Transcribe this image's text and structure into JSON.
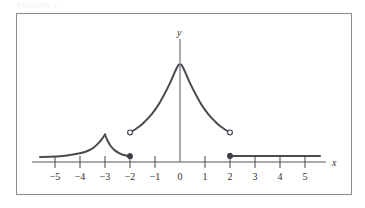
{
  "figure": {
    "caption_faint": "FIGURE 1",
    "frame_color": "#8a8a90",
    "curve_color": "#4a4a52",
    "axis_color": "#55555c",
    "background": "#ffffff"
  },
  "axes": {
    "x_label": "x",
    "y_label": "y",
    "x_ticks": [
      {
        "value": -5,
        "label": "−5"
      },
      {
        "value": -4,
        "label": "−4"
      },
      {
        "value": -3,
        "label": "−3"
      },
      {
        "value": -2,
        "label": "−2"
      },
      {
        "value": -1,
        "label": "−1"
      },
      {
        "value": 0,
        "label": "0"
      },
      {
        "value": 1,
        "label": "1"
      },
      {
        "value": 2,
        "label": "2"
      },
      {
        "value": 3,
        "label": "3"
      },
      {
        "value": 4,
        "label": "4"
      },
      {
        "value": 5,
        "label": "5"
      }
    ],
    "x_range": [
      -5.8,
      5.8
    ],
    "y_range": [
      -0.35,
      3.6
    ],
    "y_axis_at_x": 0,
    "grid": false,
    "legend": false
  },
  "chart_data": {
    "type": "line",
    "title": "",
    "subtitle": "",
    "xlabel": "x",
    "ylabel": "y",
    "xlim": [
      -5.8,
      5.8
    ],
    "ylim": [
      -0.35,
      3.6
    ],
    "grid": false,
    "legend_position": "none",
    "series": [
      {
        "name": "left-tail-branch",
        "comment": "flat tail rising to cusp at x = -3",
        "points": [
          [
            -5.6,
            0.17
          ],
          [
            -5.2,
            0.18
          ],
          [
            -4.8,
            0.2
          ],
          [
            -4.4,
            0.24
          ],
          [
            -4.0,
            0.3
          ],
          [
            -3.7,
            0.38
          ],
          [
            -3.45,
            0.5
          ],
          [
            -3.25,
            0.66
          ],
          [
            -3.1,
            0.82
          ],
          [
            -3.0,
            0.95
          ]
        ]
      },
      {
        "name": "cusp-descending-branch",
        "comment": "descends from cusp at x = -3 to closed endpoint at x = -2",
        "points": [
          [
            -3.0,
            0.95
          ],
          [
            -2.9,
            0.74
          ],
          [
            -2.78,
            0.56
          ],
          [
            -2.62,
            0.41
          ],
          [
            -2.42,
            0.3
          ],
          [
            -2.2,
            0.23
          ],
          [
            -2.0,
            0.2
          ]
        ]
      },
      {
        "name": "left-asymptotic-branch",
        "comment": "open endpoint at x = -2, rises steeply toward vertical asymptote at x = 0",
        "points": [
          [
            -2.0,
            1.02
          ],
          [
            -1.8,
            1.12
          ],
          [
            -1.6,
            1.24
          ],
          [
            -1.4,
            1.4
          ],
          [
            -1.2,
            1.58
          ],
          [
            -1.0,
            1.8
          ],
          [
            -0.8,
            2.06
          ],
          [
            -0.6,
            2.38
          ],
          [
            -0.4,
            2.72
          ],
          [
            -0.25,
            3.02
          ],
          [
            -0.12,
            3.26
          ],
          [
            -0.05,
            3.36
          ]
        ]
      },
      {
        "name": "right-asymptotic-branch",
        "comment": "falls from vertical asymptote at x = 0 to open endpoint at x = 2",
        "points": [
          [
            0.05,
            3.36
          ],
          [
            0.12,
            3.26
          ],
          [
            0.25,
            3.02
          ],
          [
            0.4,
            2.72
          ],
          [
            0.6,
            2.38
          ],
          [
            0.8,
            2.06
          ],
          [
            1.0,
            1.8
          ],
          [
            1.2,
            1.58
          ],
          [
            1.4,
            1.4
          ],
          [
            1.6,
            1.24
          ],
          [
            1.8,
            1.12
          ],
          [
            2.0,
            1.02
          ]
        ]
      },
      {
        "name": "right-horizontal-ray",
        "comment": "constant segment starting with closed endpoint at x = 2",
        "points": [
          [
            2.0,
            0.21
          ],
          [
            3.0,
            0.21
          ],
          [
            4.0,
            0.21
          ],
          [
            5.0,
            0.21
          ],
          [
            5.6,
            0.21
          ]
        ]
      }
    ],
    "endpoints": [
      {
        "name": "closed-point-left",
        "x": -2,
        "y": 0.2,
        "type": "filled"
      },
      {
        "name": "open-point-left",
        "x": -2,
        "y": 1.02,
        "type": "open"
      },
      {
        "name": "open-point-right",
        "x": 2,
        "y": 1.02,
        "type": "open"
      },
      {
        "name": "closed-point-right",
        "x": 2,
        "y": 0.21,
        "type": "filled"
      }
    ],
    "annotations": [
      {
        "name": "cusp-peak",
        "x": -3,
        "y": 0.95,
        "text": ""
      },
      {
        "name": "vertical-asymptote",
        "x": 0,
        "text": ""
      }
    ]
  }
}
